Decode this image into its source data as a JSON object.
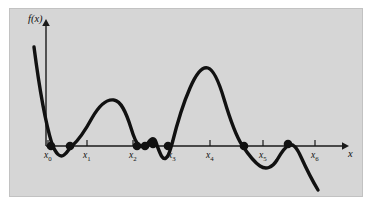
{
  "figure": {
    "kind": "function-graph",
    "panel_color": "#d6d6d6",
    "background_color": "#ffffff",
    "border_color": "#c2c2c2",
    "curve_color": "#111111",
    "axis_color": "#1a1a1a"
  },
  "axes": {
    "y_label": "f(x)",
    "x_label": "x",
    "x_axis_y": 146,
    "y_axis_x": 46,
    "x_axis_end": 345,
    "y_axis_top": 22
  },
  "ticks": [
    {
      "name": "x0",
      "base": "x",
      "sub": "0",
      "x": 48
    },
    {
      "name": "x1",
      "base": "x",
      "sub": "1",
      "x": 87
    },
    {
      "name": "x2",
      "base": "x",
      "sub": "2",
      "x": 133
    },
    {
      "name": "x3",
      "base": "x",
      "sub": "3",
      "x": 172
    },
    {
      "name": "x4",
      "base": "x",
      "sub": "4",
      "x": 210
    },
    {
      "name": "x5",
      "base": "x",
      "sub": "5",
      "x": 263
    },
    {
      "name": "x6",
      "base": "x",
      "sub": "6",
      "x": 315
    }
  ],
  "markers": [
    {
      "name": "root-near-x0",
      "x": 51,
      "y": 146
    },
    {
      "name": "root-left-of-x1",
      "x": 70,
      "y": 146
    },
    {
      "name": "root-near-x2",
      "x": 137,
      "y": 146
    },
    {
      "name": "local-min-touch-a",
      "x": 145,
      "y": 146
    },
    {
      "name": "local-max-touch",
      "x": 153,
      "y": 144
    },
    {
      "name": "root-near-x3",
      "x": 168,
      "y": 146
    },
    {
      "name": "root-right-of-x4",
      "x": 244,
      "y": 146
    },
    {
      "name": "local-max-touch-right",
      "x": 288,
      "y": 144
    }
  ],
  "chart_data": {
    "type": "line",
    "title": "",
    "xlabel": "x",
    "ylabel": "f(x)",
    "grid": false,
    "legend": null,
    "tick_labels": [
      "x0",
      "x1",
      "x2",
      "x3",
      "x4",
      "x5",
      "x6"
    ],
    "path": "M 34,47 C 38,78 44,118 52,144 C 56,154 60,158 64,155 C 68,152 69,148 72,146 C 80,139 86,129 92,118 C 100,104 108,99 114,100 C 121,101 126,112 131,128 C 134,138 136,143 139,145 C 143,147 146,146 148,143 C 150,140 152,138 154,139 C 156,140 156,143 158,148 C 161,156 163,160 166,158 C 169,156 170,150 172,144 C 176,128 182,106 190,88 C 196,74 202,66 208,68 C 214,70 219,82 224,99 C 230,119 236,136 242,145 C 248,154 254,162 260,166 C 266,170 272,168 277,160 C 281,153 285,147 289,145 C 293,143 297,148 301,157 C 306,168 312,180 318,190"
  }
}
